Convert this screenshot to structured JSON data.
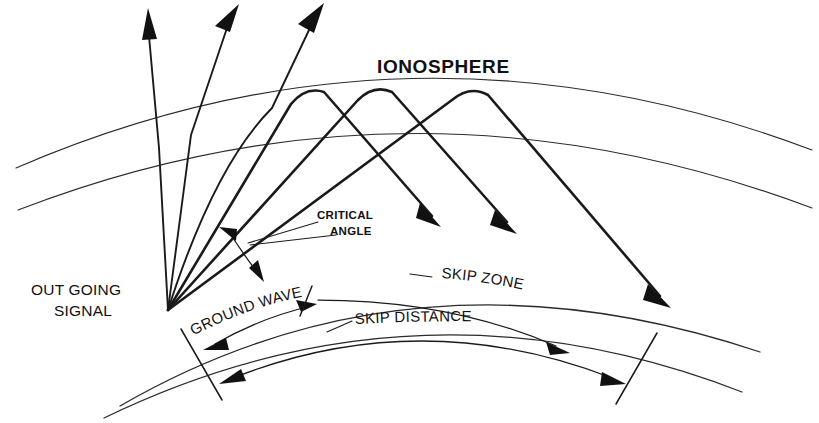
{
  "diagram": {
    "kind": "radio-wave-ionosphere-propagation",
    "background_color": "#ffffff",
    "ink_color": "#111111",
    "labels": {
      "ionosphere": "IONOSPHERE",
      "critical_angle_line1": "CRITICAL",
      "critical_angle_line2": "ANGLE",
      "out_going_line1": "OUT GOING",
      "out_going_line2": "SIGNAL",
      "ground_wave": "GROUND WAVE",
      "skip_zone": "SKIP ZONE",
      "skip_distance": "SKIP DISTANCE"
    },
    "geometry": {
      "transmitter_origin": "168,310",
      "escaping_rays": 3,
      "reflected_rays": 3,
      "ionosphere_layers": 2,
      "earth_arcs": 2
    }
  }
}
